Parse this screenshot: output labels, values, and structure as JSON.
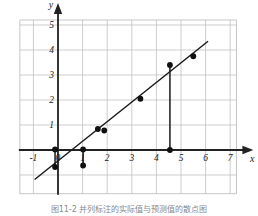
{
  "figure": {
    "caption": "图11-2  并列标注的实际值与预测值的散点图"
  },
  "chart_data": {
    "type": "scatter",
    "title": "",
    "xlabel": "x",
    "ylabel": "y",
    "xlim": [
      -1.55,
      7.25
    ],
    "ylim": [
      -1.75,
      5.2
    ],
    "grid": true,
    "legend": "none",
    "xticks": [
      -1,
      0,
      1,
      2,
      3,
      4,
      5,
      6,
      7
    ],
    "xtick_labels": [
      "-1",
      "0",
      "1",
      "2",
      "3",
      "4",
      "5",
      "6",
      "7"
    ],
    "yticks": [
      1,
      2,
      3,
      4,
      5
    ],
    "ytick_labels": [
      "1",
      "2",
      "3",
      "4",
      "5"
    ],
    "axis_arrows": true,
    "points": [
      {
        "x": -0.12,
        "y": 0.02
      },
      {
        "x": -0.12,
        "y": -0.68
      },
      {
        "x": 1.02,
        "y": 0.02
      },
      {
        "x": 1.02,
        "y": -0.62
      },
      {
        "x": 1.62,
        "y": 0.84
      },
      {
        "x": 1.88,
        "y": 0.78
      },
      {
        "x": 3.35,
        "y": 2.05
      },
      {
        "x": 4.55,
        "y": 3.4
      },
      {
        "x": 4.55,
        "y": 0.0
      },
      {
        "x": 5.5,
        "y": 3.75
      }
    ],
    "residual_segments": [
      {
        "x": -0.12,
        "y0": 0.02,
        "y1": -0.68
      },
      {
        "x": 1.02,
        "y0": 0.02,
        "y1": -0.62
      },
      {
        "x": 4.55,
        "y0": 3.4,
        "y1": 0.0
      }
    ],
    "fit_line": {
      "label": "regression line",
      "x0": -0.95,
      "y0": -1.18,
      "x1": 6.1,
      "y1": 4.35,
      "slope": 0.784,
      "intercept": -0.435
    }
  }
}
